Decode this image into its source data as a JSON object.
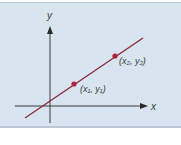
{
  "diagram": {
    "type": "coordinate-line-through-two-points",
    "axes": {
      "x_label": "x",
      "y_label": "y"
    },
    "points": [
      {
        "label": "(x₁, y₁)",
        "name": "point-1"
      },
      {
        "label": "(x₂, y₂)",
        "name": "point-2"
      }
    ],
    "colors": {
      "panel_bg": "#d8e5f0",
      "axis": "#3a3a3a",
      "line": "#8a2b3b",
      "point": "#b0213a"
    }
  }
}
